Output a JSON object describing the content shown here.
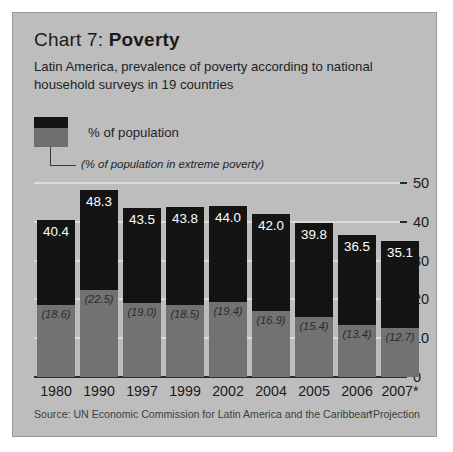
{
  "figure": {
    "title_prefix": "Chart 7: ",
    "title_bold": "Poverty",
    "subtitle": "Latin America, prevalence of poverty according to national household surveys in 19 countries",
    "source": "Source: UN Economic Commission for Latin America and the Caribbean",
    "projection_note": "*Projection",
    "panel_color": "#bdbdbd",
    "series_colors": {
      "population": "#141414",
      "extreme": "#727272"
    },
    "gridline_color": "#dcdcdc"
  },
  "legend": {
    "label": "% of population",
    "sublabel": "(% of population in extreme poverty)"
  },
  "chart_data": {
    "type": "bar",
    "title": "Chart 7: Poverty",
    "subtitle": "Latin America, prevalence of poverty according to national household surveys in 19 countries",
    "xlabel": "",
    "ylabel": "",
    "ylim": [
      0,
      50
    ],
    "yticks": [
      0,
      10,
      20,
      30,
      40,
      50
    ],
    "ytick_labels": [
      "0",
      "10",
      "20",
      "30",
      "40",
      "50"
    ],
    "grid": true,
    "legend_position": "top-left",
    "stacked": true,
    "categories": [
      "1980",
      "1990",
      "1997",
      "1999",
      "2002",
      "2004",
      "2005",
      "2006",
      "2007*"
    ],
    "series": [
      {
        "name": "% of population",
        "values": [
          40.4,
          48.3,
          43.5,
          43.8,
          44.0,
          42.0,
          39.8,
          36.5,
          35.1
        ],
        "labels": [
          "40.4",
          "48.3",
          "43.5",
          "43.8",
          "44.0",
          "42.0",
          "39.8",
          "36.5",
          "35.1"
        ]
      },
      {
        "name": "% of population in extreme poverty",
        "values": [
          18.6,
          22.5,
          19.0,
          18.5,
          19.4,
          16.9,
          15.4,
          13.4,
          12.7
        ],
        "labels": [
          "(18.6)",
          "(22.5)",
          "(19.0)",
          "(18.5)",
          "(19.4)",
          "(16.9)",
          "(15.4)",
          "(13.4)",
          "(12.7)"
        ]
      }
    ],
    "annotations": [
      "*Projection"
    ],
    "source": "Source: UN Economic Commission for Latin America and the Caribbean"
  }
}
